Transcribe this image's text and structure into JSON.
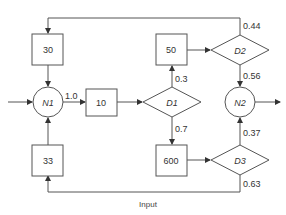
{
  "title": "· · · ·",
  "caption": "Input",
  "colors": {
    "stroke": "#555555",
    "text": "#333333",
    "background": "#ffffff"
  },
  "nodes": {
    "box_30": {
      "label": "30"
    },
    "box_33": {
      "label": "33"
    },
    "n1": {
      "label": "N1"
    },
    "box_10": {
      "label": "10"
    },
    "d1": {
      "label": "D1"
    },
    "box_50": {
      "label": "50"
    },
    "box_600": {
      "label": "600"
    },
    "d2": {
      "label": "D2"
    },
    "d3": {
      "label": "D3"
    },
    "n2": {
      "label": "N2"
    }
  },
  "edges": {
    "n1_to_10": "1.0",
    "d1_to_50": "0.3",
    "d1_to_600": "0.7",
    "d2_loop": "0.44",
    "d2_to_n2": "0.56",
    "d3_to_n2": "0.37",
    "d3_loop": "0.63"
  }
}
